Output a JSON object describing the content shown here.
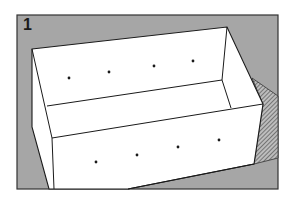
{
  "figure": {
    "step_number": "1",
    "colors": {
      "background": "#a6a6a6",
      "box_fill": "#ffffff",
      "outline": "#1a1a1a",
      "hatch": "#555555",
      "dot": "#1a1a1a"
    },
    "back_wall_dots": [
      [
        69,
        78
      ],
      [
        109,
        72
      ],
      [
        154,
        66
      ],
      [
        193,
        61
      ]
    ],
    "front_panel_dots": [
      [
        96,
        162
      ],
      [
        137,
        155
      ],
      [
        178,
        147
      ],
      [
        219,
        140
      ]
    ]
  }
}
